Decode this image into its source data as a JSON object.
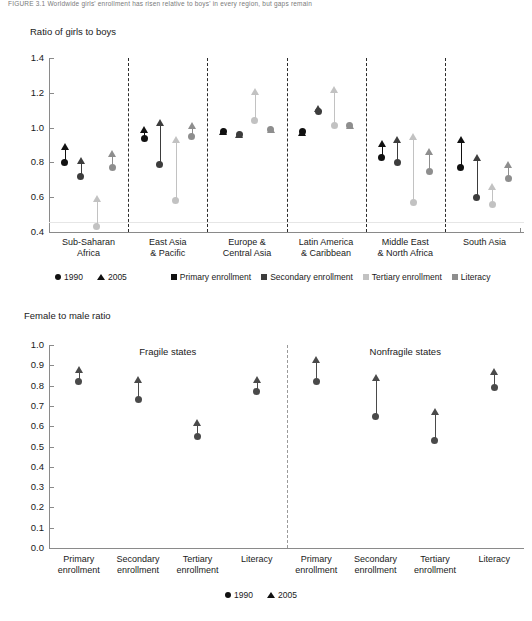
{
  "figure": {
    "caption": "FIGURE 3.1   Worldwide girls' enrollment has risen relative to boys' in every region, but gaps remain"
  },
  "colors": {
    "primary": "#111111",
    "secondary": "#3d3d3d",
    "tertiary": "#c2c2c2",
    "literacy": "#8e8e8e",
    "bottom_marker": "#4a4a4a",
    "axis": "#8a8a8a",
    "separator": "#2b2b2b"
  },
  "legend_top": {
    "year_items": [
      {
        "label": "1990",
        "marker": "circle-marker"
      },
      {
        "label": "2005",
        "marker": "triangle-marker"
      }
    ],
    "series_items": [
      {
        "label": "Primary enrollment",
        "marker": "square-swatch",
        "color": "#111111"
      },
      {
        "label": "Secondary enrollment",
        "marker": "square-swatch",
        "color": "#3d3d3d"
      },
      {
        "label": "Tertiary enrollment",
        "marker": "square-swatch",
        "color": "#c2c2c2"
      },
      {
        "label": "Literacy",
        "marker": "square-swatch",
        "color": "#8e8e8e"
      }
    ]
  },
  "legend_bottom": {
    "items": [
      {
        "label": "1990",
        "marker": "circle-marker"
      },
      {
        "label": "2005",
        "marker": "triangle-marker"
      }
    ]
  },
  "chart_data": [
    {
      "type": "scatter",
      "id": "regions-chart",
      "title": "",
      "ylabel": "Ratio of girls to boys",
      "xlabel": "",
      "ylim": [
        0.4,
        1.4
      ],
      "yticks": [
        "1.4",
        "1.2",
        "1.0",
        "0.8",
        "0.6",
        "0.4"
      ],
      "ytick_values": [
        1.4,
        1.2,
        1.0,
        0.8,
        0.6,
        0.4
      ],
      "grid": false,
      "legend_position": "below",
      "categories": [
        "Sub-Saharan Africa",
        "East Asia & Pacific",
        "Europe & Central Asia",
        "Latin America & Caribbean",
        "Middle East & North Africa",
        "South Asia"
      ],
      "category_lines": [
        [
          "Sub-Saharan",
          "Africa"
        ],
        [
          "East Asia",
          "& Pacific"
        ],
        [
          "Europe &",
          "Central Asia"
        ],
        [
          "Latin America",
          "& Caribbean"
        ],
        [
          "Middle East",
          "& North Africa"
        ],
        [
          "South Asia",
          ""
        ]
      ],
      "series": [
        {
          "name": "Primary enrollment",
          "color": "#111111",
          "values_1990": [
            0.8,
            0.94,
            0.98,
            0.98,
            0.83,
            0.77
          ],
          "values_2005": [
            0.89,
            0.99,
            0.98,
            0.97,
            0.91,
            0.93
          ]
        },
        {
          "name": "Secondary enrollment",
          "color": "#3d3d3d",
          "values_1990": [
            0.72,
            0.79,
            0.96,
            1.09,
            0.8,
            0.6
          ],
          "values_2005": [
            0.81,
            1.03,
            0.96,
            1.11,
            0.93,
            0.83
          ]
        },
        {
          "name": "Tertiary enrollment",
          "color": "#c2c2c2",
          "values_1990": [
            0.43,
            0.58,
            1.04,
            1.01,
            0.57,
            0.56
          ],
          "values_2005": [
            0.59,
            0.93,
            1.21,
            1.22,
            0.95,
            0.66
          ]
        },
        {
          "name": "Literacy",
          "color": "#8e8e8e",
          "values_1990": [
            0.77,
            0.95,
            0.99,
            1.01,
            0.75,
            0.71
          ],
          "values_2005": [
            0.85,
            1.01,
            0.99,
            1.01,
            0.86,
            0.79
          ]
        }
      ]
    },
    {
      "type": "scatter",
      "id": "fragility-chart",
      "title": "",
      "ylabel": "Female to male ratio",
      "xlabel": "",
      "ylim": [
        0.0,
        1.0
      ],
      "yticks": [
        "1.0",
        "0.9",
        "0.8",
        "0.7",
        "0.6",
        "0.5",
        "0.4",
        "0.3",
        "0.2",
        "0.1",
        "0.0"
      ],
      "ytick_values": [
        1.0,
        0.9,
        0.8,
        0.7,
        0.6,
        0.5,
        0.4,
        0.3,
        0.2,
        0.1,
        0.0
      ],
      "grid": false,
      "legend_position": "below",
      "group_labels": [
        "Fragile states",
        "Nonfragile states"
      ],
      "categories": [
        "Primary enrollment",
        "Secondary enrollment",
        "Tertiary enrollment",
        "Literacy",
        "Primary enrollment",
        "Secondary enrollment",
        "Tertiary enrollment",
        "Literacy"
      ],
      "category_lines": [
        [
          "Primary",
          "enrollment"
        ],
        [
          "Secondary",
          "enrollment"
        ],
        [
          "Tertiary",
          "enrollment"
        ],
        [
          "Literacy",
          ""
        ],
        [
          "Primary",
          "enrollment"
        ],
        [
          "Secondary",
          "enrollment"
        ],
        [
          "Tertiary",
          "enrollment"
        ],
        [
          "Literacy",
          ""
        ]
      ],
      "series": [
        {
          "name": "1990",
          "color": "#4a4a4a",
          "values": [
            0.82,
            0.73,
            0.55,
            0.77,
            0.82,
            0.65,
            0.53,
            0.79
          ]
        },
        {
          "name": "2005",
          "color": "#4a4a4a",
          "values": [
            0.88,
            0.83,
            0.62,
            0.83,
            0.93,
            0.84,
            0.67,
            0.87
          ]
        }
      ]
    }
  ]
}
